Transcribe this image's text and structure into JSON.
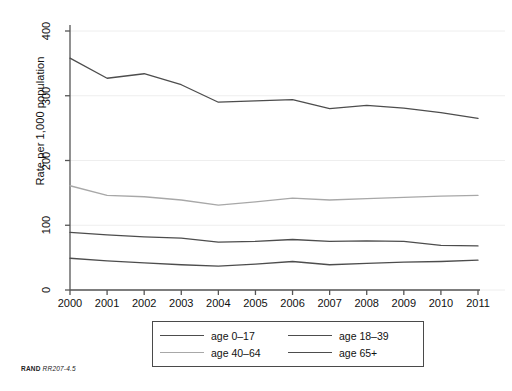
{
  "chart_data": {
    "type": "line",
    "title": "",
    "xlabel": "",
    "ylabel": "Rate per 1,000 population",
    "x": [
      2000,
      2001,
      2002,
      2003,
      2004,
      2005,
      2006,
      2007,
      2008,
      2009,
      2010,
      2011
    ],
    "categories": [
      "2000",
      "2001",
      "2002",
      "2003",
      "2004",
      "2005",
      "2006",
      "2007",
      "2008",
      "2009",
      "2010",
      "2011"
    ],
    "xlim": [
      2000,
      2011
    ],
    "ylim": [
      0,
      400
    ],
    "yticks": [
      0,
      100,
      200,
      300,
      400
    ],
    "ytick_labels": [
      "0",
      "100",
      "200",
      "300",
      "400"
    ],
    "grid": "horizontal",
    "legend_position": "bottom-center",
    "series": [
      {
        "name": "age 65+",
        "color": "#4d4d4d",
        "values": [
          358,
          327,
          334,
          317,
          290,
          292,
          294,
          280,
          285,
          281,
          274,
          265
        ]
      },
      {
        "name": "age 40-64",
        "color": "#a8a8a8",
        "values": [
          161,
          146,
          144,
          139,
          131,
          136,
          142,
          139,
          141,
          143,
          145,
          146
        ]
      },
      {
        "name": "age 0-17",
        "color": "#4d4d4d",
        "values": [
          89,
          85,
          82,
          80,
          74,
          75,
          78,
          75,
          76,
          75,
          69,
          68
        ]
      },
      {
        "name": "age 18-39",
        "color": "#4d4d4d",
        "values": [
          49,
          45,
          42,
          39,
          37,
          40,
          44,
          39,
          41,
          43,
          44,
          46
        ]
      }
    ]
  },
  "legend": {
    "entries": [
      {
        "label": "age 0–17",
        "color": "#4d4d4d"
      },
      {
        "label": "age 18–39",
        "color": "#4d4d4d"
      },
      {
        "label": "age 40–64",
        "color": "#a8a8a8"
      },
      {
        "label": "age 65+",
        "color": "#4d4d4d"
      }
    ]
  },
  "caption": {
    "mark": "RAND",
    "id": "RR207-4.5"
  },
  "colors": {
    "axis": "#555555",
    "grid": "#eeeeee",
    "dark_line": "#4d4d4d",
    "light_line": "#a8a8a8",
    "legend_border": "#4a4a4a"
  }
}
